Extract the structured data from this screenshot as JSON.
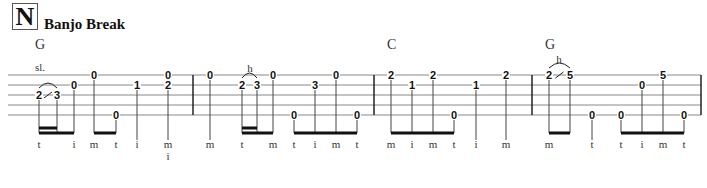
{
  "section": {
    "letter": "N",
    "title": "Banjo Break"
  },
  "chords": [
    {
      "label": "G",
      "x": 35
    },
    {
      "label": "C",
      "x": 387
    },
    {
      "label": "G",
      "x": 545
    }
  ],
  "staff": {
    "left": 8,
    "right": 701,
    "string_y": [
      75,
      85,
      95,
      105,
      115
    ],
    "barlines": [
      193,
      374,
      532,
      701
    ],
    "line_color": "#888888"
  },
  "notes": [
    {
      "x": 39,
      "frets": [
        {
          "s": 3,
          "f": "2"
        }
      ],
      "finger": "t",
      "stem_from": 3
    },
    {
      "x": 57,
      "frets": [
        {
          "s": 3,
          "f": "3"
        }
      ],
      "finger": "",
      "stem_from": 3
    },
    {
      "x": 74,
      "frets": [
        {
          "s": 2,
          "f": "0"
        }
      ],
      "finger": "i",
      "stem_from": 2
    },
    {
      "x": 94,
      "frets": [
        {
          "s": 1,
          "f": "0"
        }
      ],
      "finger": "m",
      "stem_from": 1
    },
    {
      "x": 116,
      "frets": [
        {
          "s": 5,
          "f": "0"
        }
      ],
      "finger": "t",
      "stem_from": 5
    },
    {
      "x": 137,
      "frets": [
        {
          "s": 2,
          "f": "1"
        }
      ],
      "finger": "i",
      "stem_from": 2
    },
    {
      "x": 168,
      "frets": [
        {
          "s": 1,
          "f": "0"
        },
        {
          "s": 2,
          "f": "2"
        }
      ],
      "finger": "m",
      "finger2": "i",
      "stem_from": 2
    },
    {
      "x": 210,
      "frets": [
        {
          "s": 1,
          "f": "0"
        }
      ],
      "finger": "m",
      "stem_from": 1
    },
    {
      "x": 242,
      "frets": [
        {
          "s": 2,
          "f": "2"
        }
      ],
      "finger": "t",
      "stem_from": 2
    },
    {
      "x": 257,
      "frets": [
        {
          "s": 2,
          "f": "3"
        }
      ],
      "finger": "",
      "stem_from": 2
    },
    {
      "x": 273,
      "frets": [
        {
          "s": 1,
          "f": "0"
        }
      ],
      "finger": "m",
      "stem_from": 1
    },
    {
      "x": 294,
      "frets": [
        {
          "s": 5,
          "f": "0"
        }
      ],
      "finger": "t",
      "stem_from": 5
    },
    {
      "x": 315,
      "frets": [
        {
          "s": 2,
          "f": "3"
        }
      ],
      "finger": "i",
      "stem_from": 2
    },
    {
      "x": 336,
      "frets": [
        {
          "s": 1,
          "f": "0"
        }
      ],
      "finger": "m",
      "stem_from": 1
    },
    {
      "x": 357,
      "frets": [
        {
          "s": 5,
          "f": "0"
        }
      ],
      "finger": "t",
      "stem_from": 5
    },
    {
      "x": 391,
      "frets": [
        {
          "s": 1,
          "f": "2"
        }
      ],
      "finger": "m",
      "stem_from": 1
    },
    {
      "x": 412,
      "frets": [
        {
          "s": 2,
          "f": "1"
        }
      ],
      "finger": "i",
      "stem_from": 2
    },
    {
      "x": 433,
      "frets": [
        {
          "s": 1,
          "f": "2"
        }
      ],
      "finger": "m",
      "stem_from": 1
    },
    {
      "x": 454,
      "frets": [
        {
          "s": 5,
          "f": "0"
        }
      ],
      "finger": "t",
      "stem_from": 5
    },
    {
      "x": 476,
      "frets": [
        {
          "s": 2,
          "f": "1"
        }
      ],
      "finger": "i",
      "stem_from": 2
    },
    {
      "x": 506,
      "frets": [
        {
          "s": 1,
          "f": "2"
        }
      ],
      "finger": "m",
      "stem_from": 1
    },
    {
      "x": 549,
      "frets": [
        {
          "s": 1,
          "f": "2"
        }
      ],
      "finger": "m",
      "stem_from": 1
    },
    {
      "x": 570,
      "frets": [
        {
          "s": 1,
          "f": "5"
        }
      ],
      "finger": "",
      "stem_from": 1
    },
    {
      "x": 592,
      "frets": [
        {
          "s": 5,
          "f": "0"
        }
      ],
      "finger": "t",
      "stem_from": 5
    },
    {
      "x": 621,
      "frets": [
        {
          "s": 5,
          "f": "0"
        }
      ],
      "finger": "t",
      "stem_from": 5
    },
    {
      "x": 642,
      "frets": [
        {
          "s": 2,
          "f": "0"
        }
      ],
      "finger": "i",
      "stem_from": 2
    },
    {
      "x": 663,
      "frets": [
        {
          "s": 1,
          "f": "5"
        }
      ],
      "finger": "m",
      "stem_from": 1
    },
    {
      "x": 684,
      "frets": [
        {
          "s": 5,
          "f": "0"
        }
      ],
      "finger": "t",
      "stem_from": 5
    }
  ],
  "beams": [
    {
      "x1": 39,
      "x2": 74,
      "level": 1
    },
    {
      "x1": 39,
      "x2": 57,
      "level": 2
    },
    {
      "x1": 94,
      "x2": 116,
      "level": 1
    },
    {
      "x1": 242,
      "x2": 273,
      "level": 1
    },
    {
      "x1": 242,
      "x2": 257,
      "level": 2
    },
    {
      "x1": 294,
      "x2": 357,
      "level": 1
    },
    {
      "x1": 391,
      "x2": 454,
      "level": 1
    },
    {
      "x1": 549,
      "x2": 570,
      "level": 1
    },
    {
      "x1": 621,
      "x2": 684,
      "level": 1
    }
  ],
  "techniques": [
    {
      "label": "sl.",
      "x1": 39,
      "x2": 57,
      "s": 3,
      "slash": true,
      "label_x": 40,
      "label_y": 71
    },
    {
      "label": "h",
      "x1": 242,
      "x2": 257,
      "s": 2,
      "slash": false,
      "label_x": 250,
      "label_y": 72
    },
    {
      "label": "h",
      "x1": 549,
      "x2": 570,
      "s": 1,
      "slash": true,
      "label_x": 559,
      "label_y": 63
    }
  ],
  "layout": {
    "beam_y": 133,
    "beam2_y": 128,
    "finger_y": 148,
    "finger2_y": 160
  }
}
